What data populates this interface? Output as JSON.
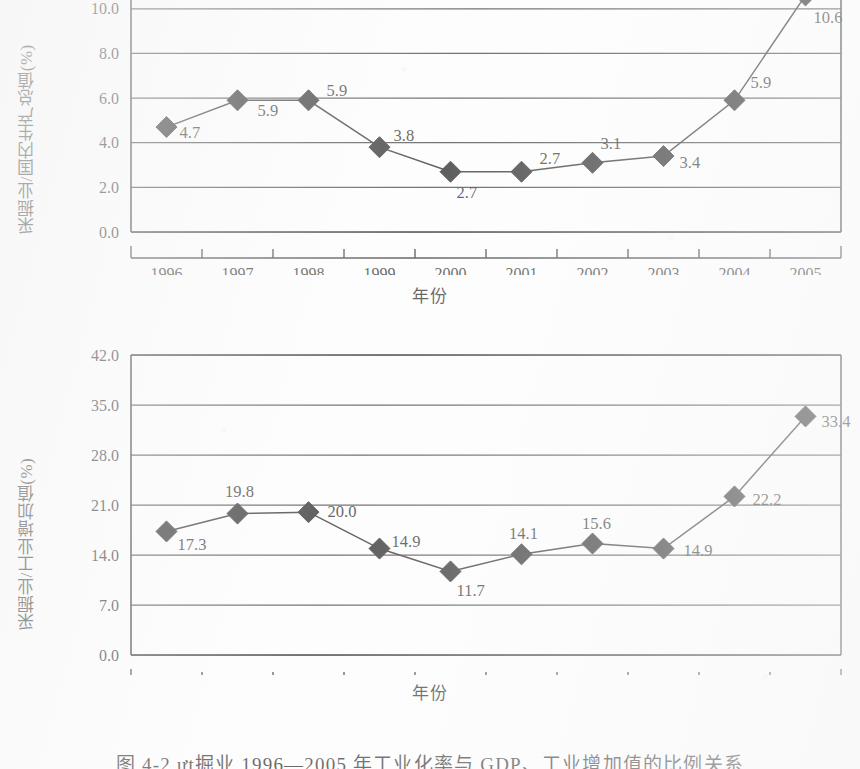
{
  "caption": {
    "text": "图 4-2  ựt掘业 1996—2005 年工业化率与 GDP、工业增加值的比例关系"
  },
  "chart_data": [
    {
      "id": "mining-to-gdp",
      "type": "line",
      "title": "",
      "xlabel": "年份",
      "ylabel": "采掘业/国内生产总值(%)",
      "categories": [
        "1996",
        "1997",
        "1998",
        "1999",
        "2000",
        "2001",
        "2002",
        "2003",
        "2004",
        "2005"
      ],
      "values": [
        4.7,
        5.9,
        5.9,
        3.8,
        2.7,
        2.7,
        3.1,
        3.4,
        5.9,
        10.6
      ],
      "data_labels": [
        "4.7",
        "5.9",
        "5.9",
        "3.8",
        "2.7",
        "2.7",
        "3.1",
        "3.4",
        "5.9",
        "10.6"
      ],
      "yticks": [
        "0.0",
        "2.0",
        "4.0",
        "6.0",
        "8.0",
        "10.0"
      ],
      "ytick_values": [
        0,
        2,
        4,
        6,
        8,
        10
      ],
      "ylim": [
        0,
        11.2
      ],
      "grid": true,
      "legend": "none",
      "marker": "diamond",
      "clipped_top": true
    },
    {
      "id": "mining-to-industrial-added-value",
      "type": "line",
      "title": "",
      "xlabel": "年份",
      "ylabel": "采掘业/工业增加值(%)",
      "categories": [
        "1996",
        "1997",
        "1998",
        "1999",
        "2000",
        "2001",
        "2002",
        "2003",
        "2004",
        "2005"
      ],
      "values": [
        17.3,
        19.8,
        20.0,
        14.9,
        11.7,
        14.1,
        15.6,
        14.9,
        22.2,
        33.4
      ],
      "data_labels": [
        "17.3",
        "19.8",
        "20.0",
        "14.9",
        "11.7",
        "14.1",
        "15.6",
        "14.9",
        "22.2",
        "33.4"
      ],
      "yticks": [
        "0.0",
        "7.0",
        "14.0",
        "21.0",
        "28.0",
        "35.0",
        "42.0"
      ],
      "ytick_values": [
        0,
        7,
        14,
        21,
        28,
        35,
        42
      ],
      "ylim": [
        0,
        42
      ],
      "grid": true,
      "legend": "none",
      "marker": "diamond",
      "clipped_top": false
    }
  ],
  "colors": {
    "ink": "#101010",
    "paper": "#fdfdfd",
    "grid": "#2a2a2a"
  }
}
